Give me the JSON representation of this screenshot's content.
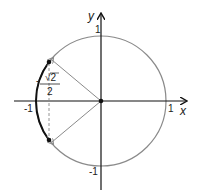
{
  "diagram": {
    "title": "",
    "type": "unit-circle",
    "axes": {
      "x_label": "x",
      "y_label": "y",
      "tick_labels": {
        "x_pos": "1",
        "x_neg": "-1",
        "y_pos": "1",
        "y_neg": "-1"
      }
    },
    "annotation": {
      "value_label_numerator": "√2",
      "value_label_sign": "-",
      "value_label_denominator": "2",
      "full": "-√2/2"
    },
    "points": [
      {
        "name": "upper-point",
        "angle_deg": 135
      },
      {
        "name": "lower-point",
        "angle_deg": 225
      },
      {
        "name": "origin",
        "x": 0,
        "y": 0
      }
    ],
    "colors": {
      "circle": "#8a8a8a",
      "highlight_arc": "#111111",
      "axes": "#111111",
      "radii": "#8a8a8a",
      "dashed": "#888888"
    }
  }
}
